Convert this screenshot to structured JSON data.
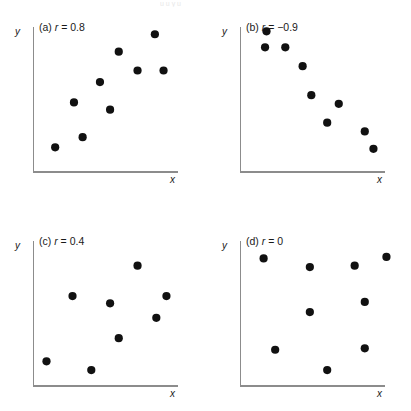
{
  "figure": {
    "background": "#ffffff",
    "dot_color": "#111111",
    "axis_color": "#8c8c8c",
    "top_artifact_text": "u u y u"
  },
  "axis_labels": {
    "x": "x",
    "y": "y"
  },
  "panels": [
    {
      "id": "a",
      "title": "(a) r = 0.8",
      "title_prefix": "(a) ",
      "title_symbol": "r",
      "title_suffix": " = 0.8",
      "r_value": 0.8
    },
    {
      "id": "b",
      "title": "(b) r = −0.9",
      "title_prefix": "(b) ",
      "title_symbol": "r",
      "title_suffix": " = −0.9",
      "r_value": -0.9
    },
    {
      "id": "c",
      "title": "(c) r = 0.4",
      "title_prefix": "(c) ",
      "title_symbol": "r",
      "title_suffix": " = 0.4",
      "r_value": 0.4
    },
    {
      "id": "d",
      "title": "(d) r = 0",
      "title_prefix": "(d) ",
      "title_symbol": "r",
      "title_suffix": " = 0",
      "r_value": 0
    }
  ],
  "chart_data": [
    {
      "type": "scatter",
      "title": "(a) r = 0.8",
      "xlabel": "x",
      "ylabel": "y",
      "xlim": [
        0,
        100
      ],
      "ylim": [
        0,
        100
      ],
      "grid": false,
      "legend": "none",
      "correlation": 0.8,
      "x": [
        15,
        34,
        28,
        46,
        53,
        59,
        72,
        84,
        90
      ],
      "y": [
        17,
        24,
        48,
        62,
        43,
        83,
        70,
        95,
        70
      ]
    },
    {
      "type": "scatter",
      "title": "(b) r = −0.9",
      "xlabel": "x",
      "ylabel": "y",
      "xlim": [
        0,
        100
      ],
      "ylim": [
        0,
        100
      ],
      "grid": false,
      "legend": "none",
      "correlation": -0.9,
      "x": [
        18,
        17,
        31,
        43,
        49,
        68,
        60,
        86,
        92
      ],
      "y": [
        97,
        86,
        86,
        73,
        53,
        47,
        34,
        28,
        16
      ]
    },
    {
      "type": "scatter",
      "title": "(c) r = 0.4",
      "xlabel": "x",
      "ylabel": "y",
      "xlim": [
        0,
        100
      ],
      "ylim": [
        0,
        100
      ],
      "grid": false,
      "legend": "none",
      "correlation": 0.4,
      "x": [
        9,
        27,
        40,
        53,
        59,
        72,
        85,
        92
      ],
      "y": [
        17,
        62,
        11,
        57,
        33,
        83,
        47,
        62
      ]
    },
    {
      "type": "scatter",
      "title": "(d) r = 0",
      "xlabel": "x",
      "ylabel": "y",
      "xlim": [
        0,
        100
      ],
      "ylim": [
        0,
        100
      ],
      "grid": false,
      "legend": "none",
      "correlation": 0,
      "x": [
        16,
        48,
        79,
        101,
        48,
        86,
        24,
        86,
        60
      ],
      "y": [
        88,
        82,
        83,
        89,
        51,
        58,
        25,
        26,
        11
      ]
    }
  ]
}
